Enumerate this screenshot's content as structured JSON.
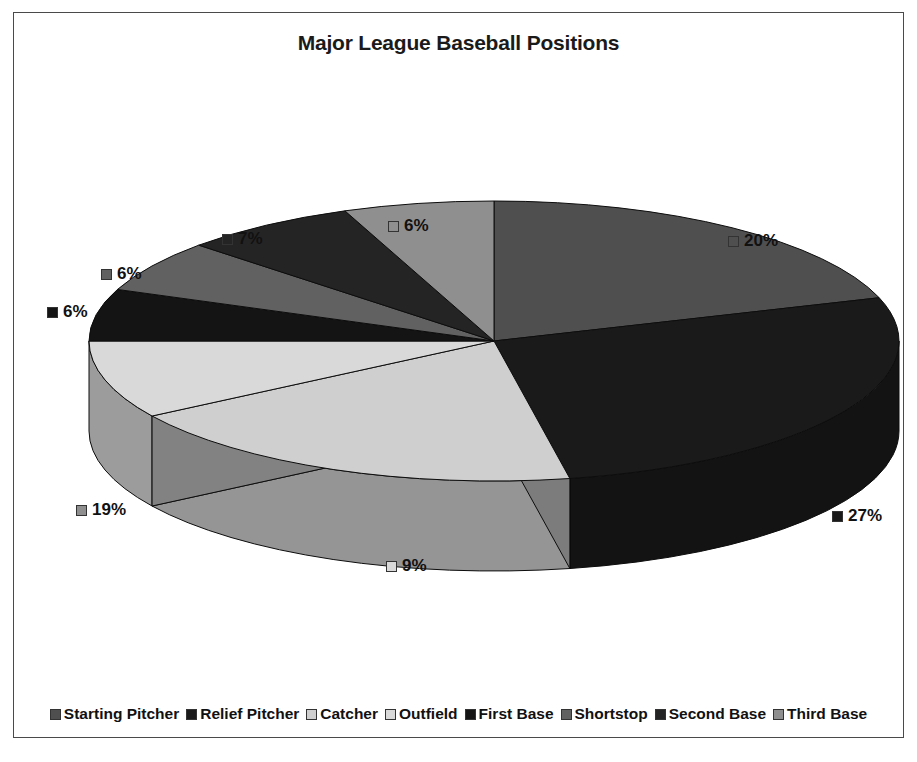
{
  "chart_data": {
    "type": "pie",
    "title": "Major League Baseball Positions",
    "categories": [
      "Starting Pitcher",
      "Relief Pitcher",
      "Catcher",
      "Outfield",
      "First Base",
      "Shortstop",
      "Second Base",
      "Third Base"
    ],
    "values": [
      20,
      27,
      19,
      9,
      6,
      6,
      7,
      6
    ],
    "value_labels": [
      "20%",
      "27%",
      "19%",
      "9%",
      "6%",
      "6%",
      "7%",
      "6%"
    ],
    "unit": "%",
    "legend_position": "bottom",
    "three_d": true,
    "slice_colors": [
      "#4f4f4f",
      "#1a1a1a",
      "#cfcfcf",
      "#d9d9d9",
      "#141414",
      "#616161",
      "#242424",
      "#8f8f8f"
    ],
    "labels": [
      {
        "text": "20%",
        "swatch": "#4f4f4f",
        "x": 714,
        "y": 218
      },
      {
        "text": "27%",
        "swatch": "#1a1a1a",
        "x": 818,
        "y": 493
      },
      {
        "text": "9%",
        "swatch": "#d9d9d9",
        "x": 372,
        "y": 543
      },
      {
        "text": "19%",
        "swatch": "#8f8f8f",
        "x": 62,
        "y": 487
      },
      {
        "text": "6%",
        "swatch": "#141414",
        "x": 33,
        "y": 289
      },
      {
        "text": "6%",
        "swatch": "#616161",
        "x": 87,
        "y": 251
      },
      {
        "text": "7%",
        "swatch": "#242424",
        "x": 208,
        "y": 216
      },
      {
        "text": "6%",
        "swatch": "#8f8f8f",
        "x": 374,
        "y": 203
      }
    ],
    "geometry": {
      "center_x": 480,
      "center_y": 328,
      "radius_x": 405,
      "radius_y": 140,
      "depth": 90,
      "start_angle_deg": -90
    }
  },
  "legend": {
    "items": [
      {
        "label": "Starting Pitcher",
        "color": "#4f4f4f"
      },
      {
        "label": "Relief Pitcher",
        "color": "#1a1a1a"
      },
      {
        "label": "Catcher",
        "color": "#cfcfcf"
      },
      {
        "label": "Outfield",
        "color": "#d9d9d9"
      },
      {
        "label": "First Base",
        "color": "#141414"
      },
      {
        "label": "Shortstop",
        "color": "#616161"
      },
      {
        "label": "Second Base",
        "color": "#242424"
      },
      {
        "label": "Third Base",
        "color": "#8f8f8f"
      }
    ]
  }
}
